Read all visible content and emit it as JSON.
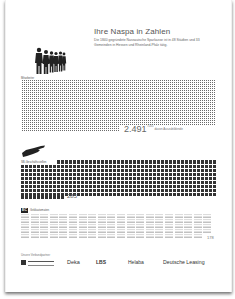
{
  "header": {
    "title": "Ihre Naspa in Zahlen",
    "intro": "Die 1840 gegründete Nassauische Sparkasse ist in 48 Städten und 33 Gemeinden in Hessen und Rheinland-Pfalz tätig."
  },
  "employees": {
    "label": "Mitarbeiter",
    "icon": "people-silhouette-icon",
    "count": "2.491",
    "sup": "/145",
    "note": "davon Auszubildende"
  },
  "branches": {
    "label": "SB-Geschäftsstellen",
    "icon": "hand-icon",
    "count": "285"
  },
  "atms": {
    "label": "Geldautomaten",
    "icon": "ec-card-icon",
    "icon_text": "EC",
    "count": "178"
  },
  "partners": {
    "label": "Unsere Verbundpartner",
    "logos": [
      "Sparkassen-Finanzgruppe",
      "Deka",
      "LBS",
      "Helaba",
      "Deutsche Leasing"
    ]
  },
  "colors": {
    "text": "#555555",
    "grid": "#333333",
    "background": "#ffffff"
  }
}
